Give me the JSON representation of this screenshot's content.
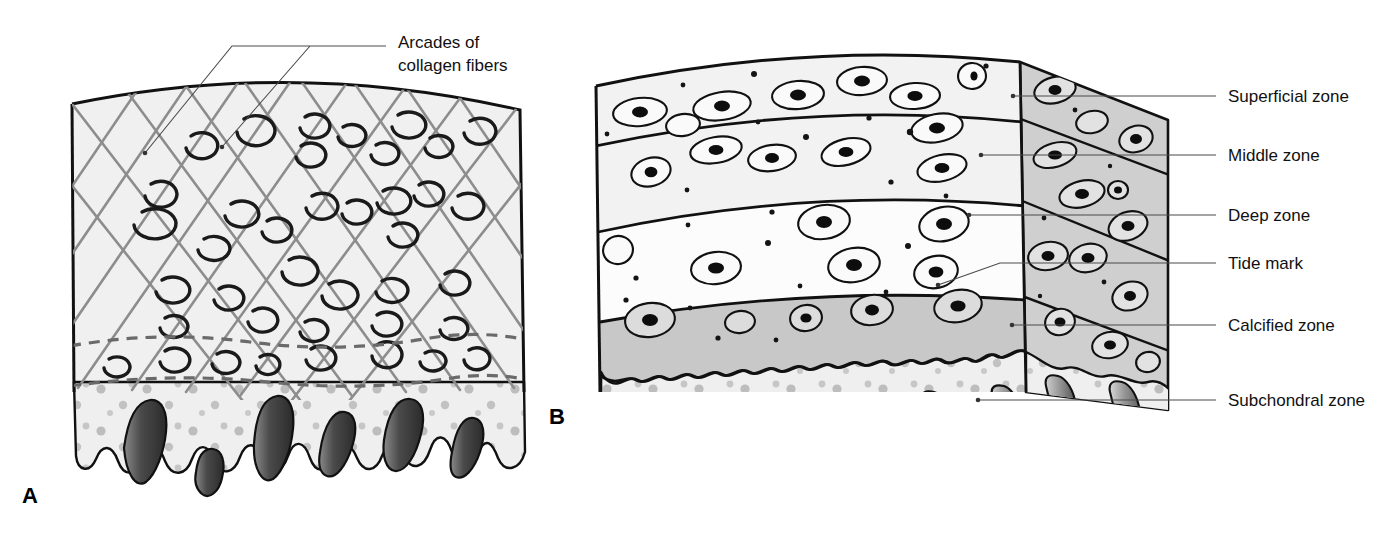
{
  "figure": {
    "background_color": "#ffffff"
  },
  "panels": [
    {
      "id": "A",
      "letter": "A",
      "letter_x": 22,
      "letter_y": 503,
      "description": "Collagen fiber arcade organization of articular cartilage",
      "fill_color": "#f0f0f0",
      "collagen_color": "#8d8d8d",
      "bone_color": "#efefef"
    },
    {
      "id": "B",
      "letter": "B",
      "letter_x": 549,
      "letter_y": 424,
      "description": "Zonal organization of articular cartilage with chondrocytes",
      "face_fill": "#f2f2f2",
      "side_fill": "#cfcfcf",
      "calcified_fill": "#c8c8c8",
      "bone_fill": "#efefef"
    }
  ],
  "callouts": {
    "panel_a": [
      {
        "name": "arcades-of-collagen-fibers",
        "line1": "Arcades of",
        "line2": "collagen fibers",
        "text_x": 398,
        "text_y": 42,
        "line_height": 23
      }
    ],
    "panel_b": [
      {
        "name": "superficial-zone",
        "label": "Superficial zone",
        "text_x": 1228,
        "text_y": 101,
        "leader_y": 96,
        "dot_x": 1013,
        "dot_y": 96
      },
      {
        "name": "middle-zone",
        "label": "Middle zone",
        "text_x": 1228,
        "text_y": 160,
        "leader_y": 155,
        "dot_x": 981,
        "dot_y": 155
      },
      {
        "name": "deep-zone",
        "label": "Deep zone",
        "text_x": 1228,
        "text_y": 220,
        "leader_y": 215,
        "dot_x": 969,
        "dot_y": 215
      },
      {
        "name": "tide-mark",
        "label": "Tide mark",
        "text_x": 1228,
        "text_y": 268,
        "leader_y": 263,
        "dot_x": 938,
        "dot_y": 285
      },
      {
        "name": "calcified-zone",
        "label": "Calcified zone",
        "text_x": 1228,
        "text_y": 330,
        "leader_y": 325,
        "dot_x": 1012,
        "dot_y": 325
      },
      {
        "name": "subchondral-zone",
        "label": "Subchondral zone",
        "text_x": 1228,
        "text_y": 405,
        "leader_y": 400,
        "dot_x": 978,
        "dot_y": 400
      }
    ]
  },
  "colors": {
    "ink": "#111111",
    "leader": "#4a4a4a",
    "collagen": "#8d8d8d",
    "cartilage_light": "#f2f2f2",
    "side_gray": "#cfcfcf",
    "calcified_gray": "#c8c8c8",
    "bone_dark": "#6e6e6e",
    "bone_speck": "#b4b4b4"
  },
  "zone_boundaries_b": {
    "superficial_bottom": 120,
    "middle_bottom": 205,
    "deep_bottom": 300,
    "tidemark": 352,
    "bone_top": 372
  }
}
